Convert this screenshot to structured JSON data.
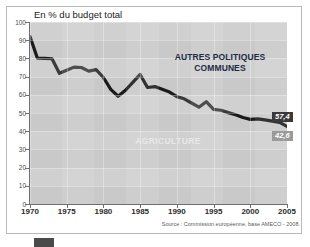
{
  "chart_data": {
    "type": "line",
    "title": "En % du budget total",
    "xlabel": "",
    "ylabel": "",
    "xlim": [
      1970,
      2005
    ],
    "ylim": [
      0,
      100
    ],
    "grid": true,
    "legend_position": "inline-annotations",
    "x_ticks": [
      "1970",
      "1975",
      "1980",
      "1985",
      "1990",
      "1995",
      "2000",
      "2005"
    ],
    "y_ticks": [
      "0",
      "10",
      "20",
      "30",
      "40",
      "50",
      "60",
      "70",
      "80",
      "90",
      "100"
    ],
    "series": [
      {
        "name": "Agriculture (part du budget total)",
        "x": [
          1970,
          1971,
          1972,
          1973,
          1974,
          1975,
          1976,
          1977,
          1978,
          1979,
          1980,
          1981,
          1982,
          1983,
          1984,
          1985,
          1986,
          1987,
          1988,
          1989,
          1990,
          1991,
          1992,
          1993,
          1994,
          1995,
          1996,
          1997,
          1998,
          1999,
          2000,
          2001,
          2002,
          2003,
          2004,
          2005
        ],
        "values": [
          92.0,
          80.2,
          80.0,
          79.8,
          71.8,
          73.5,
          75.2,
          75.0,
          73.0,
          73.8,
          69.5,
          63.0,
          59.2,
          62.5,
          66.8,
          71.2,
          64.0,
          64.5,
          63.0,
          61.5,
          59.0,
          57.8,
          55.5,
          53.2,
          56.2,
          52.0,
          51.5,
          50.2,
          49.0,
          47.5,
          46.5,
          46.8,
          46.2,
          45.5,
          44.8,
          42.6
        ]
      }
    ],
    "annotations": [
      {
        "name": "autres-politiques-communes",
        "text": "AUTRES POLITIQUES\nCOMMUNES",
        "line1": "AUTRES POLITIQUES",
        "line2": "COMMUNES",
        "color": "#1d2b45"
      },
      {
        "name": "agriculture",
        "text": "AGRICULTURE",
        "color": "#e8e8e8"
      }
    ],
    "end_value_labels": [
      {
        "name": "autres-politiques-value",
        "value": "57,4",
        "color": "#3a3a3a"
      },
      {
        "name": "agriculture-value",
        "value": "42,6",
        "color": "#9a9a9a"
      }
    ],
    "source": "Source : Commission européenne, base AMECO - 2008."
  },
  "chart": {
    "title": "En % du budget total",
    "source": "Source : Commission européenne, base AMECO - 2008.",
    "label_autres_line1": "AUTRES POLITIQUES",
    "label_autres_line2": "COMMUNES",
    "label_agriculture": "AGRICULTURE",
    "badge_upper": "57,4",
    "badge_lower": "42,6"
  },
  "colors": {
    "plot_background": "#c9c9c9",
    "series_line": "#1a1a1a",
    "annotation_dark": "#1d2b45",
    "annotation_light": "#e8e8e8",
    "badge_upper_bg": "#3a3a3a",
    "badge_lower_bg": "#9a9a9a",
    "frame_border": "#b9b9b9"
  }
}
